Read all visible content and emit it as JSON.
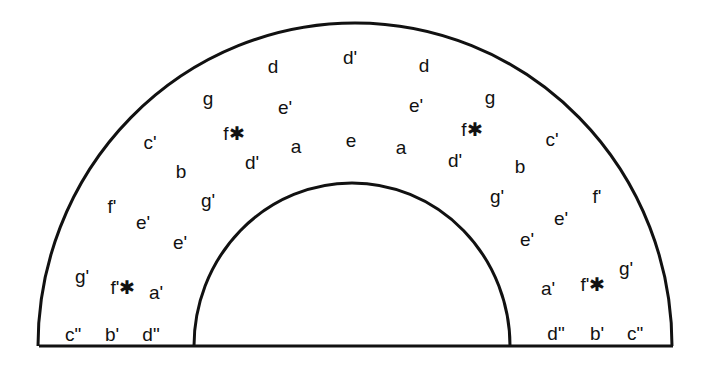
{
  "diagram": {
    "type": "semicircular-ring",
    "stroke_color": "#111111",
    "background": "#ffffff",
    "outer_arc": {
      "cx": 355,
      "base_y": 346,
      "rx": 317,
      "ry": 323
    },
    "inner_arc": {
      "cx": 352,
      "base_y": 346,
      "rx": 158,
      "ry": 163
    },
    "baseline": {
      "x1": 39,
      "x2": 673,
      "y": 346
    }
  },
  "notes": [
    {
      "label": "d'",
      "x": 350,
      "y": 57
    },
    {
      "label": "d",
      "x": 273,
      "y": 66
    },
    {
      "label": "d",
      "x": 424,
      "y": 65
    },
    {
      "label": "g",
      "x": 208,
      "y": 98
    },
    {
      "label": "g",
      "x": 490,
      "y": 97
    },
    {
      "label": "e'",
      "x": 285,
      "y": 107
    },
    {
      "label": "e'",
      "x": 416,
      "y": 105
    },
    {
      "label": "c'",
      "x": 150,
      "y": 142
    },
    {
      "label": "c'",
      "x": 552,
      "y": 139
    },
    {
      "label": "f✱",
      "x": 234,
      "y": 133
    },
    {
      "label": "f✱",
      "x": 472,
      "y": 129
    },
    {
      "label": "e",
      "x": 351,
      "y": 140
    },
    {
      "label": "a",
      "x": 296,
      "y": 146
    },
    {
      "label": "a",
      "x": 401,
      "y": 147
    },
    {
      "label": "d'",
      "x": 252,
      "y": 162
    },
    {
      "label": "d'",
      "x": 455,
      "y": 160
    },
    {
      "label": "b",
      "x": 181,
      "y": 171
    },
    {
      "label": "b",
      "x": 520,
      "y": 166
    },
    {
      "label": "g'",
      "x": 208,
      "y": 200
    },
    {
      "label": "g'",
      "x": 497,
      "y": 196
    },
    {
      "label": "f'",
      "x": 112,
      "y": 206
    },
    {
      "label": "f'",
      "x": 597,
      "y": 196
    },
    {
      "label": "e'",
      "x": 143,
      "y": 222
    },
    {
      "label": "e'",
      "x": 561,
      "y": 218
    },
    {
      "label": "e'",
      "x": 180,
      "y": 242
    },
    {
      "label": "e'",
      "x": 527,
      "y": 239
    },
    {
      "label": "g'",
      "x": 82,
      "y": 276
    },
    {
      "label": "g'",
      "x": 626,
      "y": 268
    },
    {
      "label": "f'✱",
      "x": 123,
      "y": 287
    },
    {
      "label": "f'✱",
      "x": 593,
      "y": 284
    },
    {
      "label": "a'",
      "x": 156,
      "y": 292
    },
    {
      "label": "a'",
      "x": 548,
      "y": 288
    },
    {
      "label": "c\"",
      "x": 73,
      "y": 334
    },
    {
      "label": "b'",
      "x": 112,
      "y": 334
    },
    {
      "label": "d\"",
      "x": 151,
      "y": 334
    },
    {
      "label": "d\"",
      "x": 556,
      "y": 333
    },
    {
      "label": "b'",
      "x": 597,
      "y": 333
    },
    {
      "label": "c\"",
      "x": 635,
      "y": 333
    }
  ]
}
